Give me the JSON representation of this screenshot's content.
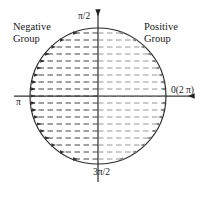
{
  "figure": {
    "background_color": "#ffffff",
    "stroke_color": "#2b2b2b",
    "arrow_color_left": "#3a3a3a",
    "arrow_color_right": "#7d7d7d"
  },
  "labels": {
    "negative_group": "Negative\nGroup",
    "positive_group": "Positive\nGroup",
    "angle_top": "π/2",
    "angle_left": "π",
    "angle_right": "0(2 π)",
    "angle_bottom": "3π/2"
  },
  "geometry": {
    "center_x": 98,
    "center_y": 96,
    "radius": 68,
    "x_axis_label_left": "π",
    "x_axis_label_right": "0(2 π)",
    "y_axis_label_top": "π/2",
    "y_axis_label_bottom": "3π/2"
  },
  "chart_data": {
    "type": "diagram",
    "circle": {
      "cx": 98,
      "cy": 96,
      "r": 68
    },
    "axes": {
      "x_axis": {
        "y": 96,
        "x_start": 14,
        "x_end": 196,
        "arrow_at": "right"
      },
      "y_axis": {
        "x": 98,
        "y_start": 182,
        "y_end": 8,
        "arrow_at": "top"
      }
    },
    "groups": [
      {
        "name": "Negative Group",
        "side": "left",
        "arrow_direction": "left",
        "label_x": 13,
        "label_y": 21
      },
      {
        "name": "Positive Group",
        "side": "right",
        "arrow_direction": "right",
        "label_x": 144,
        "label_y": 21
      }
    ],
    "arrow_rows": {
      "count": 19,
      "spacing": 7,
      "first_row_y": 33,
      "last_row_y": 159,
      "style": "dashed",
      "origin": "vertical axis at x=98",
      "terminus": "circle boundary"
    },
    "tick_labels": [
      "π/2",
      "π",
      "0(2 π)",
      "3π/2"
    ]
  }
}
